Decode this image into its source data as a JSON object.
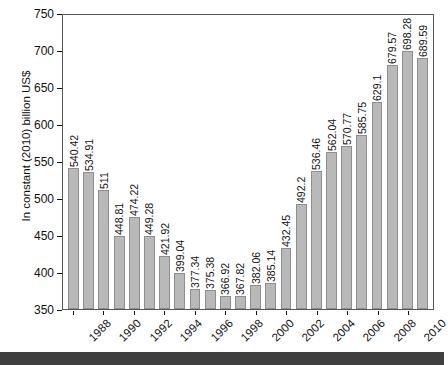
{
  "chart_data": {
    "type": "bar",
    "title": "",
    "xlabel": "",
    "ylabel": "In constant (2010) billion US$",
    "ylim": [
      350,
      750
    ],
    "yticks": [
      350,
      400,
      450,
      500,
      550,
      600,
      650,
      700,
      750
    ],
    "grid": false,
    "legend": null,
    "categories": [
      "1988",
      "1989",
      "1990",
      "1991",
      "1992",
      "1993",
      "1994",
      "1995",
      "1996",
      "1997",
      "1998",
      "1999",
      "2000",
      "2001",
      "2002",
      "2003",
      "2004",
      "2005",
      "2006",
      "2007",
      "2008",
      "2009",
      "2010",
      "2011"
    ],
    "visible_tick_labels": [
      "1988",
      "1990",
      "1992",
      "1994",
      "1996",
      "1998",
      "2000",
      "2002",
      "2004",
      "2006",
      "2008",
      "2010"
    ],
    "values": [
      540.42,
      534.91,
      511,
      448.81,
      474.22,
      449.28,
      421.92,
      399.04,
      377.34,
      375.38,
      366.92,
      367.82,
      382.06,
      385.14,
      432.45,
      492.2,
      536.46,
      562.04,
      570.77,
      585.75,
      629.1,
      679.57,
      698.28,
      689.59
    ],
    "value_labels": [
      "540.42",
      "534.91",
      "511",
      "448.81",
      "474.22",
      "449.28",
      "421.92",
      "399.04",
      "377.34",
      "375.38",
      "366.92",
      "367.82",
      "382.06",
      "385.14",
      "432.45",
      "492.2",
      "536.46",
      "562.04",
      "570.77",
      "585.75",
      "629.1",
      "679.57",
      "698.28",
      "689.59"
    ],
    "bar_color": "#b9b9b9",
    "bar_edge_color": "#8e8e8e"
  }
}
